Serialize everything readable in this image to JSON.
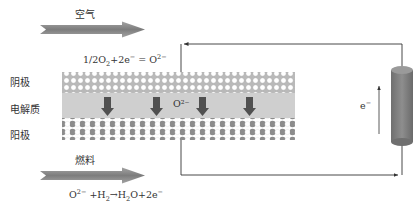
{
  "diagram": {
    "air": {
      "label": "空气"
    },
    "fuel": {
      "label": "燃料"
    },
    "layers": {
      "cathode": {
        "label": "阴极"
      },
      "electrolyte": {
        "label": "电解质",
        "ion_label": "O²⁻"
      },
      "anode": {
        "label": "阳极"
      }
    },
    "equations": {
      "cathode_reaction": {
        "lhs": "1/2O",
        "lhs_sub": "2",
        "mid": "+2e",
        "mid_sup": "−",
        "eq": " = O",
        "rhs_sup": "2−"
      },
      "anode_reaction": {
        "a": "O",
        "a_sup": "2−",
        "b": " +H",
        "b_sub": "2",
        "c": "→H",
        "c_sub": "2",
        "d": "O+2e",
        "d_sup": "−"
      }
    },
    "circuit": {
      "electron_label": "e",
      "electron_sup": "−"
    },
    "colors": {
      "arrow_gray": "#8a8a8a",
      "cathode_bg": "#bdbdbd",
      "electrolyte": "#cfcfcf",
      "anode_dark": "#8c8c8c",
      "ion_arrow": "#555555",
      "load": "#7a7a7a",
      "wire": "#333333"
    }
  }
}
